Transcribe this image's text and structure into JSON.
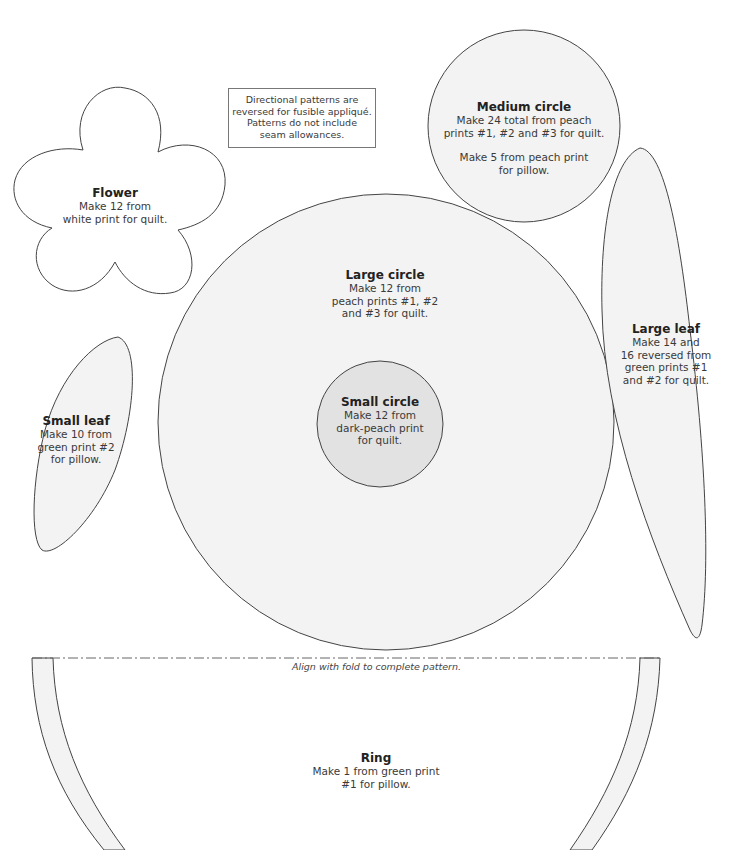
{
  "page": {
    "colors": {
      "background": "#ffffff",
      "shape_fill_light": "#f3f3f3",
      "shape_fill_dark": "#e2e2e2",
      "outline": "#444444",
      "text": "#3a3a3a"
    }
  },
  "note": {
    "lines": [
      "Directional patterns are",
      "reversed for fusible appliqué.",
      "Patterns do not include",
      "seam allowances."
    ]
  },
  "pieces": {
    "flower": {
      "title": "Flower",
      "lines": [
        "Make 12 from",
        "white print for quilt."
      ]
    },
    "medium_circle": {
      "title": "Medium circle",
      "lines": [
        "Make 24 total from peach",
        "prints #1, #2 and #3 for quilt."
      ],
      "lines2": [
        "Make 5 from peach print",
        "for pillow."
      ]
    },
    "large_circle": {
      "title": "Large circle",
      "lines": [
        "Make 12 from",
        "peach prints #1, #2",
        "and #3 for quilt."
      ]
    },
    "small_circle": {
      "title": "Small circle",
      "lines": [
        "Make 12 from",
        "dark-peach print",
        "for quilt."
      ]
    },
    "large_leaf": {
      "title": "Large leaf",
      "lines": [
        "Make 14 and",
        "16 reversed from",
        "green prints #1",
        "and #2 for quilt."
      ]
    },
    "small_leaf": {
      "title": "Small leaf",
      "lines": [
        "Make 10 from",
        "green print #2",
        "for pillow."
      ]
    },
    "ring": {
      "title": "Ring",
      "lines": [
        "Make 1 from green print",
        "#1 for pillow."
      ],
      "fold_note": "Align with fold to complete pattern."
    }
  }
}
